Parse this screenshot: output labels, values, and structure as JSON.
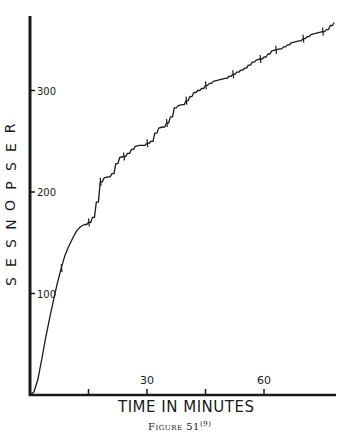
{
  "chart_data": {
    "type": "line",
    "title": "",
    "caption": "Figure 51",
    "caption_superscript": "(9)",
    "xlabel": "TIME IN MINUTES",
    "ylabel": "RESPONSES",
    "xlim": [
      0,
      78
    ],
    "ylim": [
      0,
      373
    ],
    "x_ticks": [
      15,
      30,
      45,
      60
    ],
    "x_tick_labels": [
      "",
      "30",
      "",
      "60"
    ],
    "y_ticks": [
      100,
      200,
      300
    ],
    "y_tick_labels": [
      "100",
      "200",
      "300"
    ],
    "grid": false,
    "legend": null,
    "style": "cumulative record (stepped)",
    "x": [
      0,
      1,
      2,
      3,
      4,
      5,
      6,
      7,
      8,
      9,
      10,
      11,
      12,
      13,
      14,
      15,
      16,
      17,
      18,
      19,
      20,
      21,
      22,
      23,
      24,
      25,
      26,
      27,
      28,
      29,
      30,
      31,
      32,
      33,
      34,
      35,
      36,
      37,
      38,
      39,
      40,
      41,
      42,
      43,
      44,
      45,
      46,
      47,
      48,
      49,
      50,
      51,
      52,
      53,
      54,
      55,
      56,
      57,
      58,
      59,
      60,
      61,
      62,
      63,
      64,
      65,
      66,
      67,
      68,
      69,
      70,
      71,
      72,
      73,
      74,
      75,
      76,
      77,
      78
    ],
    "values": [
      0,
      3,
      15,
      35,
      56,
      75,
      93,
      110,
      125,
      138,
      147,
      155,
      162,
      166,
      168,
      170,
      175,
      190,
      210,
      214,
      215,
      218,
      228,
      234,
      235,
      238,
      242,
      245,
      246,
      246,
      248,
      250,
      258,
      263,
      264,
      268,
      274,
      283,
      285,
      286,
      290,
      294,
      298,
      300,
      302,
      305,
      307,
      309,
      310,
      311,
      312,
      314,
      316,
      318,
      320,
      322,
      325,
      328,
      330,
      331,
      333,
      336,
      339,
      340,
      341,
      343,
      345,
      347,
      348,
      349,
      351,
      353,
      355,
      356,
      357,
      358,
      360,
      364,
      367
    ]
  },
  "labels": {
    "ylabel_letters": [
      "R",
      "E",
      "S",
      "P",
      "O",
      "N",
      "S",
      "E",
      "S"
    ]
  },
  "colors": {
    "ink": "#1a1a1a",
    "paper": "#ffffff"
  }
}
